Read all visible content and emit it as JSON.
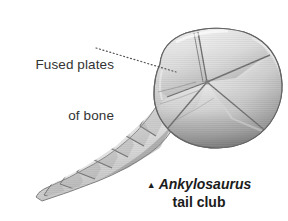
{
  "figure": {
    "subject": "Ankylosaurus tail club",
    "background_color": "#ffffff",
    "annotation": {
      "line1": "Fused plates",
      "line2": "of bone",
      "text_color": "#333333",
      "leader_style": "dotted",
      "leader_color": "#555555",
      "leader_from": [
        96,
        48
      ],
      "leader_to": [
        176,
        72
      ]
    },
    "caption": {
      "marker": "▲",
      "genus": "Ankylosaurus",
      "line2": "tail club",
      "text_color": "#1c1c1c"
    },
    "illustration": {
      "type": "grayscale-pen-and-ink",
      "description": "Fossil tail club of Ankylosaurus shown in oblique view: a large rounded bilobed mass of fused osteoderm plates at right, joined to a tapering segmented tail handle of interlocking vertebrae running down to the lower left.",
      "palette": {
        "highlight": "#f4f4f4",
        "light": "#e2e2e2",
        "mid": "#c9c9c9",
        "shade": "#a6a6a6",
        "dark": "#7d7d7d",
        "outline": "#6b6b6b",
        "suture": "#5e5e5e"
      },
      "parts": [
        {
          "name": "club-plate-upper-left",
          "label": "fused plate"
        },
        {
          "name": "club-plate-upper-right",
          "label": "fused plate"
        },
        {
          "name": "club-plate-right",
          "label": "fused plate"
        },
        {
          "name": "club-plate-lower",
          "label": "fused plate"
        },
        {
          "name": "club-plate-left",
          "label": "fused plate"
        },
        {
          "name": "tail-handle",
          "label": "fused tail vertebrae"
        }
      ],
      "suture_center": [
        207,
        82
      ]
    }
  }
}
